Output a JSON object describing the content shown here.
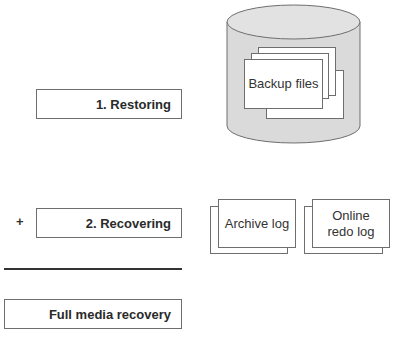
{
  "steps": {
    "restoring": "1. Restoring",
    "plus_sign": "+",
    "recovering": "2. Recovering",
    "result": "Full media recovery"
  },
  "storage": {
    "backup_files": "Backup files",
    "archive_log": "Archive log",
    "online_redo_log": "Online redo log"
  },
  "colors": {
    "cylinder_fill": "#dadada",
    "stroke": "#6e6e6e",
    "rule": "#333333"
  }
}
